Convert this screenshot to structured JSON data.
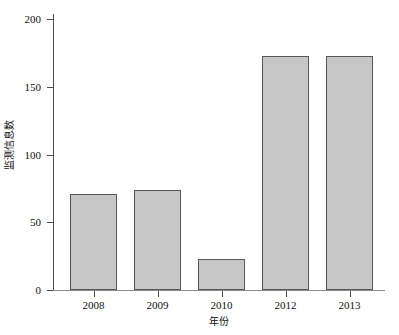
{
  "chart_data": {
    "type": "bar",
    "title": "",
    "subtitle": "",
    "xlabel": "年份",
    "ylabel": "监测信息数",
    "categories": [
      "2008",
      "2009",
      "2010",
      "2012",
      "2013"
    ],
    "values": [
      71,
      74,
      23,
      173,
      173
    ],
    "series": [
      {
        "name": "监测信息数",
        "values": [
          71,
          74,
          23,
          173,
          173
        ]
      }
    ],
    "ylim": [
      0,
      200
    ],
    "yticks": [
      0,
      50,
      100,
      150,
      200
    ],
    "ytick_labels": [
      "0",
      "50",
      "100",
      "150",
      "200"
    ],
    "grid": false,
    "legend": false,
    "legend_position": "none",
    "bar_fill_color": "#c6c6c6",
    "bar_edge_color": "#585858",
    "axis_color": "#4d4d4d",
    "background_color": "#ffffff"
  }
}
